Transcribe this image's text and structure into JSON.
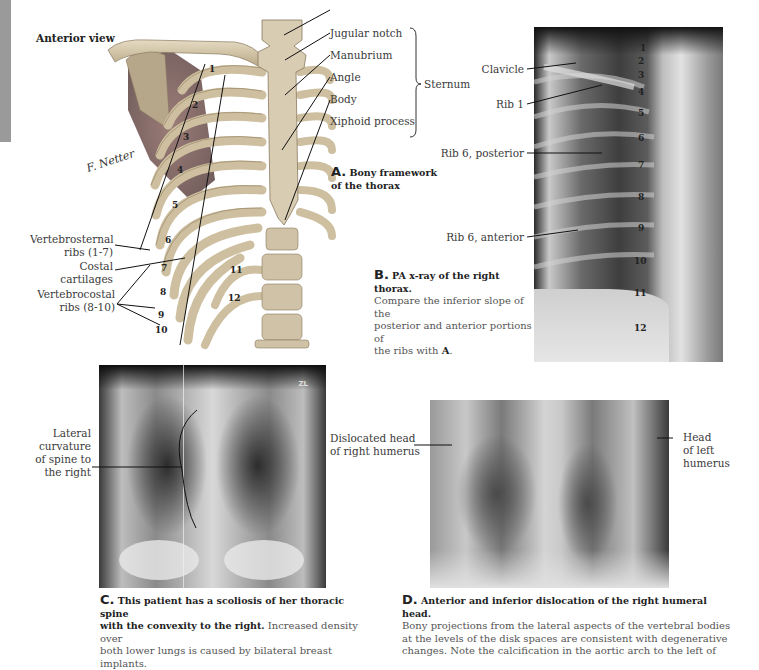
{
  "figure_a": {
    "view_title": "Anterior view",
    "caption_letter": "A.",
    "caption_text": "Bony framework of the thorax",
    "caption_line1": "Bony framework",
    "caption_line2": "of the thorax",
    "sternum_labels": [
      "Jugular notch",
      "Manubrium",
      "Angle",
      "Body",
      "Xiphoid process"
    ],
    "sternum_group_label": "Sternum",
    "left_labels": {
      "vertebrosternal_1": "Vertebrosternal",
      "vertebrosternal_2": "ribs (1-7)",
      "costal_1": "Costal",
      "costal_2": "cartilages",
      "vertebrocostal_1": "Vertebrocostal",
      "vertebrocostal_2": "ribs (8-10)"
    },
    "rib_numbers": [
      "1",
      "2",
      "3",
      "4",
      "5",
      "6",
      "7",
      "8",
      "9",
      "10",
      "11",
      "12"
    ],
    "signature": "F. Netter"
  },
  "figure_b": {
    "labels": [
      "Clavicle",
      "Rib 1",
      "Rib 6, posterior",
      "Rib 6, anterior"
    ],
    "rib_numbers": [
      "1",
      "2",
      "3",
      "4",
      "5",
      "6",
      "7",
      "8",
      "9",
      "10",
      "11",
      "12"
    ],
    "caption_letter": "B.",
    "caption_bold": "PA x-ray of the right thorax.",
    "caption_line1": "Compare the inferior slope of the",
    "caption_line2": "posterior and anterior portions of",
    "caption_line3_pre": "the ribs with ",
    "caption_line3_ref": "A",
    "caption_line3_post": "."
  },
  "figure_c": {
    "label_lines": [
      "Lateral",
      "curvature",
      "of spine to",
      "the right"
    ],
    "marker": "ZL",
    "caption_letter": "C.",
    "caption_bold_1": "This patient has a scoliosis of her thoracic spine",
    "caption_bold_2": "with the convexity to the right.",
    "caption_rest_1": " Increased density over",
    "caption_rest_2": "both lower lungs is caused by bilateral breast implants."
  },
  "figure_d": {
    "left_label_1": "Dislocated head",
    "left_label_2": "of right humerus",
    "right_label_1": "Head",
    "right_label_2": "of left",
    "right_label_3": "humerus",
    "caption_letter": "D.",
    "caption_bold": "Anterior and inferior dislocation of the right humeral head.",
    "caption_line1": "Bony projections from the lateral aspects of the vertebral bodies",
    "caption_line2": "at the levels of the disk spaces are consistent with degenerative",
    "caption_line3": "changes. Note the calcification in the aortic arch to the left of"
  },
  "colors": {
    "side_tab": "#9a9a9a",
    "bone": "#d9ccb0",
    "bone_shadow": "#a8987a",
    "muscle": "#7d5a55",
    "xray_dark": "#1a1a1a",
    "xray_light": "#e8e8e8"
  }
}
